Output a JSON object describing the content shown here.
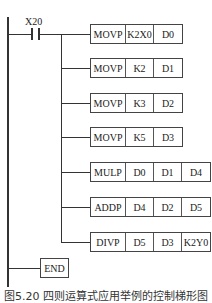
{
  "diagram": {
    "type": "plc-ladder-diagram",
    "contact": {
      "label": "X20",
      "kind": "normally-open"
    },
    "rungs": [
      {
        "op": "MOVP",
        "operands": [
          "K2X0",
          "D0"
        ]
      },
      {
        "op": "MOVP",
        "operands": [
          "K2",
          "D1"
        ]
      },
      {
        "op": "MOVP",
        "operands": [
          "K3",
          "D2"
        ]
      },
      {
        "op": "MOVP",
        "operands": [
          "K5",
          "D3"
        ]
      },
      {
        "op": "MULP",
        "operands": [
          "D0",
          "D1",
          "D4"
        ]
      },
      {
        "op": "ADDP",
        "operands": [
          "D4",
          "D2",
          "D5"
        ]
      },
      {
        "op": "DIVP",
        "operands": [
          "D5",
          "D3",
          "K2Y0"
        ]
      }
    ],
    "end_label": "END",
    "caption": "图5.20  四则运算式应用举例的控制梯形图"
  }
}
